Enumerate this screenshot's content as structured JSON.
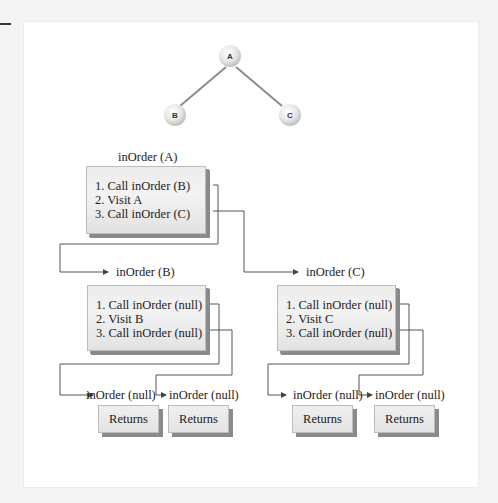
{
  "tree": {
    "nodes": [
      {
        "id": "A",
        "label": "A"
      },
      {
        "id": "B",
        "label": "B"
      },
      {
        "id": "C",
        "label": "C"
      }
    ],
    "edges": [
      [
        "A",
        "B"
      ],
      [
        "A",
        "C"
      ]
    ]
  },
  "calls": {
    "a": {
      "title": "inOrder (A)",
      "steps": [
        "1. Call inOrder (B)",
        "2. Visit A",
        "3. Call inOrder (C)"
      ]
    },
    "b": {
      "title": "inOrder (B)",
      "steps": [
        "1. Call inOrder (null)",
        "2. Visit B",
        "3. Call inOrder (null)"
      ]
    },
    "c": {
      "title": "inOrder (C)",
      "steps": [
        "1. Call inOrder (null)",
        "2. Visit C",
        "3. Call inOrder (null)"
      ]
    },
    "null_calls": [
      {
        "title": "inOrder (null)",
        "result": "Returns"
      },
      {
        "title": "inOrder (null)",
        "result": "Returns"
      },
      {
        "title": "inOrder (null)",
        "result": "Returns"
      },
      {
        "title": "inOrder (null)",
        "result": "Returns"
      }
    ]
  },
  "colors": {
    "box_fill": "#ececec",
    "box_shadow": "#8a8a8a",
    "line": "#555555",
    "tree_edge": "#8c8c8c"
  }
}
